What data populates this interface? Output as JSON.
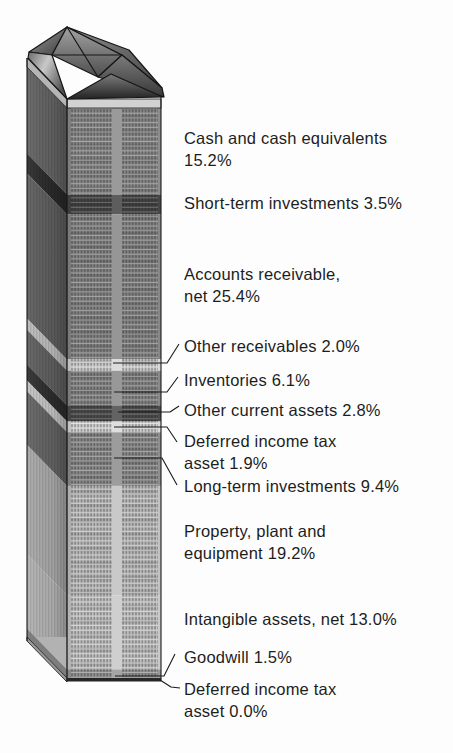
{
  "page": {
    "background": "#fdfdfd"
  },
  "chart_data": {
    "type": "bar",
    "variant": "pictorial-stacked-building-column",
    "title": "",
    "unit": "percent of total assets",
    "total": 100.0,
    "legend": "none",
    "categories": [
      "Cash and cash equivalents",
      "Short-term investments",
      "Accounts receivable, net",
      "Other receivables",
      "Inventories",
      "Other current assets",
      "Deferred income tax asset",
      "Long-term investments",
      "Property, plant and equipment",
      "Intangible assets, net",
      "Goodwill",
      "Deferred income tax asset"
    ],
    "values": [
      15.2,
      3.5,
      25.4,
      2.0,
      6.1,
      2.8,
      1.9,
      9.4,
      19.2,
      13.0,
      1.5,
      0.0
    ],
    "segments": [
      {
        "name": "Cash and cash equivalents",
        "value": 15.2,
        "front_color": "#8d8d8d",
        "side_color": "#636363",
        "label_lines": [
          "Cash and cash equivalents",
          "15.2%"
        ],
        "label_top": 128,
        "leader": null
      },
      {
        "name": "Short-term investments",
        "value": 3.5,
        "front_color": "#474747",
        "side_color": "#2b2b2b",
        "label_lines": [
          "Short-term investments 3.5%"
        ],
        "label_top": 193,
        "leader": null
      },
      {
        "name": "Accounts receivable, net",
        "value": 25.4,
        "front_color": "#888888",
        "side_color": "#5e5e5e",
        "label_lines": [
          "Accounts receivable,",
          "net 25.4%"
        ],
        "label_top": 264,
        "leader": null
      },
      {
        "name": "Other receivables",
        "value": 2.0,
        "front_color": "#d9d9d9",
        "side_color": "#bcbcbc",
        "label_lines": [
          "Other receivables 2.0%"
        ],
        "label_top": 336,
        "leader": [
          [
            113,
            363
          ],
          [
            167,
            363
          ],
          [
            179,
            344
          ]
        ]
      },
      {
        "name": "Inventories",
        "value": 6.1,
        "front_color": "#8a8a8a",
        "side_color": "#5f5f5f",
        "label_lines": [
          "Inventories 6.1%"
        ],
        "label_top": 370,
        "leader": [
          [
            114,
            392
          ],
          [
            167,
            392
          ],
          [
            178,
            377
          ]
        ]
      },
      {
        "name": "Other current assets",
        "value": 2.8,
        "front_color": "#4e4e4e",
        "side_color": "#2e2e2e",
        "label_lines": [
          "Other current assets 2.8%"
        ],
        "label_top": 400,
        "leader": [
          [
            118,
            412
          ],
          [
            170,
            412
          ],
          [
            179,
            406
          ]
        ]
      },
      {
        "name": "Deferred income tax asset",
        "value": 1.9,
        "front_color": "#dadada",
        "side_color": "#c4c4c4",
        "label_lines": [
          "Deferred income tax",
          "asset 1.9%"
        ],
        "label_top": 431,
        "leader": [
          [
            114,
            427
          ],
          [
            167,
            427
          ],
          [
            177,
            442
          ]
        ]
      },
      {
        "name": "Long-term investments",
        "value": 9.4,
        "front_color": "#8f8f8f",
        "side_color": "#646464",
        "label_lines": [
          "Long-term investments 9.4%"
        ],
        "label_top": 476,
        "leader": [
          [
            114,
            458
          ],
          [
            162,
            458
          ],
          [
            177,
            485
          ]
        ]
      },
      {
        "name": "Property, plant and equipment",
        "value": 19.2,
        "front_color": "#c2c2c2",
        "side_color": "#a9a9a9",
        "label_lines": [
          "Property, plant and",
          "equipment 19.2%"
        ],
        "label_top": 521,
        "leader": null
      },
      {
        "name": "Intangible assets, net",
        "value": 13.0,
        "front_color": "#c9c9c9",
        "side_color": "#b2b2b2",
        "label_lines": [
          "Intangible assets, net 13.0%"
        ],
        "label_top": 609,
        "leader": null
      },
      {
        "name": "Goodwill",
        "value": 1.5,
        "front_color": "#999999",
        "side_color": "#7d7d7d",
        "label_lines": [
          "Goodwill 1.5%"
        ],
        "label_top": 647,
        "leader": [
          [
            115,
            676
          ],
          [
            164,
            676
          ],
          [
            175,
            654
          ]
        ]
      },
      {
        "name": "Deferred income tax asset",
        "value": 0.0,
        "front_color": "#8d8d8d",
        "side_color": "#6a6a6a",
        "label_lines": [
          "Deferred income tax",
          "asset 0.0%"
        ],
        "label_top": 679,
        "leader": [
          [
            160,
            680
          ],
          [
            171,
            687
          ],
          [
            180,
            688
          ]
        ]
      }
    ],
    "layout": {
      "canvas_w": 453,
      "canvas_h": 753,
      "front_x": 67,
      "front_w": 94,
      "front_top": 108,
      "front_bottom": 678,
      "side_dx": -40,
      "side_dy": -41,
      "cornice_top": 99,
      "cornice_h": 9,
      "label_x": 184,
      "line_color": "#1a1a1a",
      "text_color": "#1d1d1d",
      "axis": "none",
      "grid": false
    }
  }
}
